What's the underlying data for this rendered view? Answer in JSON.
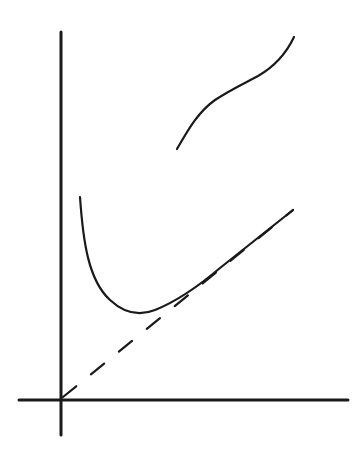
{
  "figure": {
    "stroke_color": "#1a1a1a",
    "background": "#ffffff",
    "axes": {
      "origin": [
        62,
        399
      ],
      "x_axis": {
        "from": [
          19,
          400
        ],
        "to": [
          348,
          400
        ]
      },
      "y_axis": {
        "from": [
          61,
          32
        ],
        "to": [
          61,
          435
        ]
      }
    },
    "asymptote": {
      "style": "dashed",
      "from": [
        63,
        397
      ],
      "to": [
        293,
        210
      ]
    },
    "curves": [
      {
        "name": "lower-u-curve",
        "path": "M80,197 C83,240 88,280 110,300 C125,314 140,316 155,310 C180,300 200,285 220,268 C245,248 270,228 293,210"
      },
      {
        "name": "upper-s-curve",
        "path": "M177,149 C188,130 198,112 215,100 C230,90 245,83 258,76 C272,68 285,56 294,37"
      }
    ],
    "labels": []
  }
}
